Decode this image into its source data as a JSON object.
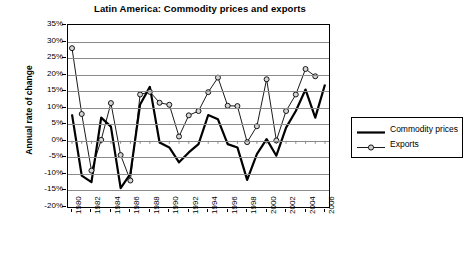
{
  "chart_data": {
    "type": "line",
    "title": "Latin America: Commodity prices and exports",
    "xlabel": "",
    "ylabel": "Annual rate of change",
    "ylim": [
      -20,
      35
    ],
    "ytick_step": 5,
    "ytick_labels": [
      "35%",
      "30%",
      "25%",
      "20%",
      "15%",
      "10%",
      "5%",
      "0%",
      "-5%",
      "-10%",
      "-15%",
      "-20%"
    ],
    "ytick_values": [
      35,
      30,
      25,
      20,
      15,
      10,
      5,
      0,
      -5,
      -10,
      -15,
      -20
    ],
    "grid": true,
    "legend_position": "right",
    "x": [
      1980,
      1981,
      1982,
      1983,
      1984,
      1985,
      1986,
      1987,
      1988,
      1989,
      1990,
      1991,
      1992,
      1993,
      1994,
      1995,
      1996,
      1997,
      1998,
      1999,
      2000,
      2001,
      2002,
      2003,
      2004,
      2005,
      2006
    ],
    "xtick_labels": [
      "1980",
      "1982",
      "1984",
      "1986",
      "1988",
      "1990",
      "1992",
      "1994",
      "1996",
      "1998",
      "2000",
      "2002",
      "2004",
      "2006"
    ],
    "xtick_values": [
      1980,
      1982,
      1984,
      1986,
      1988,
      1990,
      1992,
      1994,
      1996,
      1998,
      2000,
      2002,
      2004,
      2006
    ],
    "series": [
      {
        "name": "Commodity prices",
        "marker": "none",
        "line_width": 2.2,
        "color": "#000000",
        "values": [
          8.0,
          -10.5,
          -12.5,
          7.0,
          4.3,
          -14.3,
          -10.0,
          11.0,
          16.3,
          -0.5,
          -2.0,
          -6.5,
          -3.5,
          -1.0,
          7.8,
          6.5,
          -1.0,
          -2.0,
          -11.8,
          -4.0,
          0.5,
          -4.5,
          4.0,
          9.0,
          15.5,
          7.0,
          17.0
        ]
      },
      {
        "name": "Exports",
        "marker": "circle",
        "line_width": 0.9,
        "color": "#000000",
        "values": [
          28.0,
          8.1,
          -9.0,
          0.3,
          11.4,
          -4.3,
          -12.0,
          14.0,
          14.8,
          11.5,
          10.9,
          1.3,
          7.7,
          9.0,
          14.7,
          19.1,
          10.6,
          10.5,
          -0.4,
          4.4,
          18.6,
          0.1,
          9.0,
          14.0,
          21.7,
          19.5,
          null
        ]
      }
    ]
  },
  "legend": {
    "items": [
      {
        "label": "Commodity prices",
        "style": "thick-line"
      },
      {
        "label": "Exports",
        "style": "thin-line-marker"
      }
    ]
  }
}
